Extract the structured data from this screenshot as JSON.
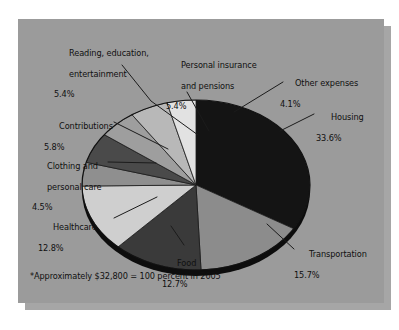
{
  "figure": {
    "footnote": "*Approximately $32,800 = 100 percent in 2005",
    "panel_color": "#9b9b9b",
    "shadow_color": "#a6a6a6",
    "page_color": "#ffffff",
    "text_color": "#101010"
  },
  "chart_data": {
    "type": "pie",
    "title": "",
    "subtitle": "",
    "note": "*Approximately $32,800 = 100 percent in 2005",
    "total_label": "$32,800 = 100 percent in 2005",
    "units": "percent",
    "legend": "none (direct labels with leader lines)",
    "grid": false,
    "start_angle_deg": -90,
    "direction": "clockwise",
    "categories": [
      "Housing",
      "Transportation",
      "Food",
      "Healthcare",
      "Clothing and personal care",
      "Contributions",
      "Reading, education, entertainment",
      "Personal insurance and pensions",
      "Other expenses"
    ],
    "values": [
      33.6,
      15.7,
      12.7,
      12.8,
      4.5,
      5.8,
      5.4,
      5.4,
      4.1
    ],
    "colors": [
      "#141414",
      "#8c8c8c",
      "#3a3a3a",
      "#cfcfcf",
      "#8f8f8f",
      "#4a4a4a",
      "#9e9e9e",
      "#b8b8b8",
      "#e2e2e2"
    ],
    "slices": [
      {
        "label": "Housing",
        "percent": 33.6,
        "percent_text": "33.6%",
        "color": "#141414"
      },
      {
        "label": "Transportation",
        "percent": 15.7,
        "percent_text": "15.7%",
        "color": "#8c8c8c"
      },
      {
        "label": "Food",
        "percent": 12.7,
        "percent_text": "12.7%",
        "color": "#3a3a3a"
      },
      {
        "label": "Healthcare",
        "percent": 12.8,
        "percent_text": "12.8%",
        "color": "#cfcfcf"
      },
      {
        "label": "Clothing and personal care",
        "percent": 4.5,
        "percent_text": "4.5%",
        "color": "#8f8f8f"
      },
      {
        "label": "Contributions",
        "percent": 5.8,
        "percent_text": "5.8%",
        "color": "#4a4a4a"
      },
      {
        "label": "Reading, education, entertainment",
        "percent": 5.4,
        "percent_text": "5.4%",
        "color": "#9e9e9e"
      },
      {
        "label": "Personal insurance and pensions",
        "percent": 5.4,
        "percent_text": "5.4%",
        "color": "#b8b8b8"
      },
      {
        "label": "Other expenses",
        "percent": 4.1,
        "percent_text": "4.1%",
        "color": "#e2e2e2"
      }
    ]
  },
  "labels": {
    "housing": {
      "name": "Housing",
      "pct": "33.6%"
    },
    "transport": {
      "name": "Transportation",
      "pct": "15.7%"
    },
    "food": {
      "name": "Food",
      "pct": "12.7%"
    },
    "healthcare": {
      "name": "Healthcare",
      "pct": "12.8%"
    },
    "clothing": {
      "line1": "Clothing and",
      "line2": "personal care",
      "pct": "4.5%"
    },
    "contributions": {
      "name": "Contributions",
      "pct": "5.8%"
    },
    "reading": {
      "line1": "Reading, education,",
      "line2": "entertainment",
      "pct": "5.4%"
    },
    "personal": {
      "line1": "Personal insurance",
      "line2": "and pensions",
      "pct": "5.4%"
    },
    "other": {
      "name": "Other expenses",
      "pct": "4.1%"
    }
  }
}
